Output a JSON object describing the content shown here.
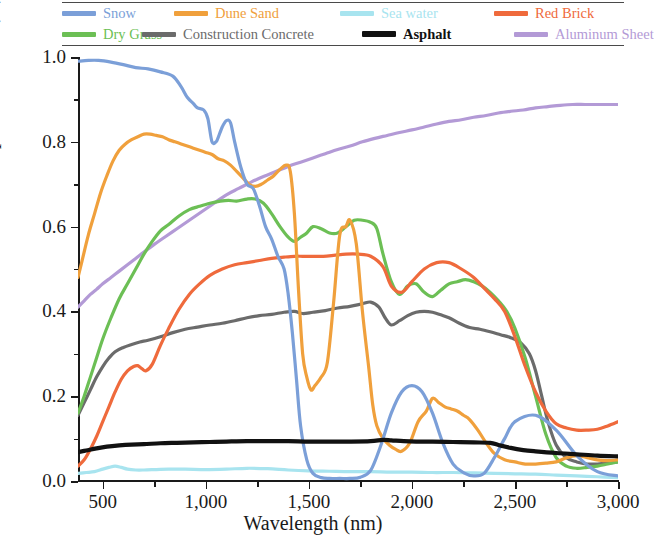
{
  "legend": {
    "rows": [
      [
        {
          "label": "Snow",
          "color": "#7b9fd8",
          "key": "snow"
        },
        {
          "label": "Dune Sand",
          "color": "#f0a03c",
          "key": "dune_sand"
        },
        {
          "label": "Sea water",
          "color": "#a8e4ef",
          "key": "sea_water"
        },
        {
          "label": "Red Brick",
          "color": "#ef6a3c",
          "key": "red_brick"
        }
      ],
      [
        {
          "label": "Dry Grass",
          "color": "#6cbf55",
          "key": "dry_grass"
        },
        {
          "label": "Construction Concrete",
          "color": "#6b6b6b",
          "key": "concrete"
        },
        {
          "label": "Asphalt",
          "color": "#111111",
          "key": "asphalt"
        },
        {
          "label": "Aluminum Sheet",
          "color": "#b39ad6",
          "key": "aluminum_sheet"
        }
      ]
    ]
  },
  "axes": {
    "x_label": "Wavelength (nm)",
    "y_label": "Spectral Albedo (%)",
    "x_ticks": [
      "500",
      "1,000",
      "1,500",
      "2,000",
      "2,500",
      "3,000"
    ],
    "x_tick_values": [
      500,
      1000,
      1500,
      2000,
      2500,
      3000
    ],
    "y_ticks": [
      "0.0",
      "0.2",
      "0.4",
      "0.6",
      "0.8",
      "1.0"
    ],
    "y_tick_values": [
      0.0,
      0.2,
      0.4,
      0.6,
      0.8,
      1.0
    ],
    "x_min": 380,
    "x_max": 3000,
    "y_min": 0.0,
    "y_max": 1.0
  },
  "chart_data": {
    "type": "line",
    "title": "",
    "xlabel": "Wavelength (nm)",
    "ylabel": "Spectral Albedo (%)",
    "xlim": [
      380,
      3000
    ],
    "ylim": [
      0.0,
      1.0
    ],
    "grid": false,
    "legend_position": "top",
    "series": [
      {
        "name": "Snow",
        "color": "#7b9fd8",
        "x": [
          380,
          430,
          480,
          540,
          600,
          660,
          720,
          780,
          840,
          880,
          910,
          940,
          960,
          990,
          1010,
          1030,
          1050,
          1060,
          1080,
          1100,
          1120,
          1140,
          1170,
          1200,
          1230,
          1260,
          1290,
          1320,
          1350,
          1380,
          1400,
          1420,
          1440,
          1460,
          1490,
          1520,
          1560,
          1600,
          1650,
          1700,
          1750,
          1800,
          1850,
          1900,
          1950,
          2000,
          2050,
          2100,
          2150,
          2200,
          2250,
          2300,
          2350,
          2400,
          2450,
          2500,
          2600,
          2700,
          2800,
          2900,
          3000
        ],
        "y": [
          0.99,
          0.992,
          0.992,
          0.988,
          0.982,
          0.975,
          0.972,
          0.965,
          0.955,
          0.93,
          0.905,
          0.89,
          0.88,
          0.875,
          0.855,
          0.8,
          0.8,
          0.81,
          0.835,
          0.85,
          0.845,
          0.8,
          0.74,
          0.7,
          0.69,
          0.65,
          0.6,
          0.57,
          0.53,
          0.5,
          0.44,
          0.35,
          0.24,
          0.13,
          0.05,
          0.018,
          0.008,
          0.006,
          0.006,
          0.006,
          0.009,
          0.025,
          0.085,
          0.16,
          0.21,
          0.225,
          0.21,
          0.16,
          0.09,
          0.04,
          0.02,
          0.012,
          0.018,
          0.055,
          0.1,
          0.14,
          0.155,
          0.12,
          0.06,
          0.022,
          0.012
        ]
      },
      {
        "name": "Dune Sand",
        "color": "#f0a03c",
        "x": [
          380,
          400,
          430,
          460,
          490,
          520,
          550,
          580,
          610,
          640,
          670,
          700,
          730,
          760,
          790,
          820,
          850,
          880,
          910,
          940,
          970,
          1000,
          1030,
          1060,
          1090,
          1120,
          1150,
          1180,
          1210,
          1240,
          1270,
          1300,
          1330,
          1360,
          1390,
          1410,
          1430,
          1450,
          1470,
          1490,
          1510,
          1530,
          1560,
          1590,
          1620,
          1650,
          1680,
          1700,
          1730,
          1760,
          1790,
          1810,
          1830,
          1860,
          1890,
          1920,
          1950,
          1990,
          2030,
          2070,
          2100,
          2130,
          2160,
          2190,
          2220,
          2250,
          2280,
          2320,
          2360,
          2400,
          2450,
          2500,
          2550,
          2600,
          2650,
          2700,
          2750,
          2800,
          2850,
          2900,
          2950,
          3000
        ],
        "y": [
          0.48,
          0.52,
          0.58,
          0.63,
          0.68,
          0.72,
          0.755,
          0.78,
          0.795,
          0.805,
          0.812,
          0.818,
          0.818,
          0.815,
          0.812,
          0.805,
          0.8,
          0.795,
          0.79,
          0.785,
          0.78,
          0.775,
          0.77,
          0.76,
          0.755,
          0.745,
          0.73,
          0.715,
          0.7,
          0.695,
          0.7,
          0.71,
          0.72,
          0.735,
          0.745,
          0.73,
          0.63,
          0.45,
          0.3,
          0.245,
          0.215,
          0.225,
          0.245,
          0.28,
          0.42,
          0.58,
          0.6,
          0.615,
          0.56,
          0.4,
          0.27,
          0.18,
          0.13,
          0.1,
          0.085,
          0.075,
          0.07,
          0.09,
          0.14,
          0.165,
          0.195,
          0.185,
          0.175,
          0.17,
          0.165,
          0.155,
          0.145,
          0.12,
          0.09,
          0.065,
          0.05,
          0.045,
          0.04,
          0.04,
          0.042,
          0.045,
          0.055,
          0.06,
          0.055,
          0.05,
          0.048,
          0.05
        ]
      },
      {
        "name": "Sea water",
        "color": "#a8e4ef",
        "x": [
          380,
          420,
          460,
          500,
          530,
          560,
          590,
          620,
          660,
          700,
          760,
          820,
          900,
          1000,
          1100,
          1200,
          1300,
          1400,
          1500,
          1600,
          1700,
          1800,
          1900,
          2000,
          2100,
          2200,
          2300,
          2400,
          2500,
          2600,
          2700,
          2800,
          2900,
          3000
        ],
        "y": [
          0.018,
          0.02,
          0.022,
          0.028,
          0.032,
          0.035,
          0.032,
          0.028,
          0.026,
          0.026,
          0.027,
          0.028,
          0.028,
          0.027,
          0.028,
          0.03,
          0.029,
          0.026,
          0.024,
          0.023,
          0.022,
          0.022,
          0.021,
          0.021,
          0.02,
          0.02,
          0.019,
          0.018,
          0.017,
          0.016,
          0.014,
          0.012,
          0.01,
          0.008
        ]
      },
      {
        "name": "Red Brick",
        "color": "#ef6a3c",
        "x": [
          380,
          410,
          440,
          470,
          500,
          530,
          560,
          590,
          620,
          650,
          670,
          690,
          710,
          740,
          780,
          820,
          870,
          920,
          970,
          1020,
          1080,
          1140,
          1200,
          1260,
          1320,
          1380,
          1430,
          1470,
          1520,
          1570,
          1620,
          1680,
          1740,
          1800,
          1860,
          1900,
          1950,
          2000,
          2060,
          2120,
          2180,
          2240,
          2300,
          2360,
          2400,
          2450,
          2500,
          2550,
          2600,
          2650,
          2700,
          2750,
          2800,
          2850,
          2900,
          2950,
          3000
        ],
        "y": [
          0.035,
          0.05,
          0.075,
          0.105,
          0.14,
          0.175,
          0.21,
          0.24,
          0.26,
          0.27,
          0.272,
          0.265,
          0.26,
          0.275,
          0.32,
          0.36,
          0.405,
          0.44,
          0.465,
          0.485,
          0.5,
          0.51,
          0.515,
          0.52,
          0.525,
          0.528,
          0.53,
          0.53,
          0.53,
          0.53,
          0.532,
          0.535,
          0.535,
          0.53,
          0.505,
          0.46,
          0.445,
          0.47,
          0.5,
          0.515,
          0.515,
          0.5,
          0.48,
          0.45,
          0.43,
          0.4,
          0.34,
          0.27,
          0.21,
          0.165,
          0.135,
          0.125,
          0.12,
          0.12,
          0.122,
          0.13,
          0.14
        ]
      },
      {
        "name": "Dry Grass",
        "color": "#6cbf55",
        "x": [
          380,
          410,
          440,
          470,
          500,
          540,
          580,
          620,
          660,
          700,
          740,
          780,
          820,
          870,
          920,
          970,
          1020,
          1070,
          1110,
          1150,
          1200,
          1240,
          1280,
          1320,
          1360,
          1400,
          1430,
          1460,
          1490,
          1520,
          1560,
          1600,
          1640,
          1680,
          1720,
          1760,
          1800,
          1830,
          1860,
          1900,
          1940,
          1980,
          2020,
          2060,
          2100,
          2140,
          2180,
          2220,
          2260,
          2300,
          2340,
          2380,
          2420,
          2460,
          2500,
          2550,
          2600,
          2650,
          2700,
          2750,
          2800,
          2850,
          2900,
          2950,
          3000
        ],
        "y": [
          0.16,
          0.2,
          0.245,
          0.29,
          0.335,
          0.385,
          0.43,
          0.465,
          0.5,
          0.535,
          0.565,
          0.59,
          0.605,
          0.625,
          0.64,
          0.648,
          0.655,
          0.66,
          0.662,
          0.66,
          0.665,
          0.665,
          0.655,
          0.63,
          0.6,
          0.575,
          0.565,
          0.575,
          0.585,
          0.6,
          0.595,
          0.585,
          0.585,
          0.6,
          0.615,
          0.615,
          0.61,
          0.595,
          0.535,
          0.47,
          0.44,
          0.46,
          0.465,
          0.445,
          0.435,
          0.45,
          0.465,
          0.47,
          0.475,
          0.47,
          0.46,
          0.445,
          0.425,
          0.4,
          0.36,
          0.29,
          0.2,
          0.11,
          0.055,
          0.035,
          0.03,
          0.032,
          0.035,
          0.04,
          0.045
        ]
      },
      {
        "name": "Construction Concrete",
        "color": "#6b6b6b",
        "x": [
          380,
          410,
          440,
          470,
          500,
          530,
          560,
          600,
          640,
          680,
          720,
          780,
          840,
          900,
          960,
          1020,
          1080,
          1140,
          1200,
          1260,
          1320,
          1380,
          1430,
          1470,
          1520,
          1580,
          1640,
          1700,
          1760,
          1800,
          1840,
          1870,
          1900,
          1940,
          1980,
          2020,
          2060,
          2100,
          2140,
          2180,
          2230,
          2280,
          2330,
          2380,
          2430,
          2480,
          2530,
          2570,
          2600,
          2630,
          2660,
          2700,
          2750,
          2800,
          2850,
          2900,
          2950,
          3000
        ],
        "y": [
          0.155,
          0.185,
          0.215,
          0.245,
          0.27,
          0.29,
          0.305,
          0.315,
          0.322,
          0.328,
          0.332,
          0.34,
          0.35,
          0.358,
          0.363,
          0.368,
          0.372,
          0.378,
          0.385,
          0.39,
          0.393,
          0.398,
          0.4,
          0.395,
          0.398,
          0.402,
          0.408,
          0.412,
          0.418,
          0.422,
          0.41,
          0.385,
          0.368,
          0.378,
          0.39,
          0.398,
          0.4,
          0.398,
          0.392,
          0.385,
          0.372,
          0.362,
          0.358,
          0.352,
          0.345,
          0.338,
          0.325,
          0.3,
          0.26,
          0.2,
          0.14,
          0.085,
          0.055,
          0.045,
          0.04,
          0.04,
          0.042,
          0.045
        ]
      },
      {
        "name": "Asphalt",
        "color": "#111111",
        "x": [
          380,
          420,
          470,
          520,
          580,
          640,
          700,
          780,
          860,
          940,
          1020,
          1100,
          1200,
          1300,
          1400,
          1500,
          1600,
          1700,
          1800,
          1860,
          1900,
          1960,
          2020,
          2100,
          2200,
          2300,
          2380,
          2420,
          2480,
          2540,
          2600,
          2700,
          2800,
          2900,
          3000
        ],
        "y": [
          0.068,
          0.072,
          0.077,
          0.081,
          0.084,
          0.086,
          0.087,
          0.089,
          0.09,
          0.091,
          0.092,
          0.093,
          0.094,
          0.094,
          0.094,
          0.093,
          0.093,
          0.093,
          0.094,
          0.097,
          0.096,
          0.094,
          0.093,
          0.093,
          0.092,
          0.091,
          0.09,
          0.085,
          0.078,
          0.073,
          0.07,
          0.066,
          0.063,
          0.06,
          0.058
        ]
      },
      {
        "name": "Aluminum Sheet",
        "color": "#b39ad6",
        "x": [
          380,
          410,
          440,
          470,
          500,
          540,
          580,
          620,
          660,
          700,
          750,
          800,
          860,
          920,
          980,
          1040,
          1100,
          1160,
          1220,
          1280,
          1340,
          1400,
          1460,
          1520,
          1580,
          1640,
          1700,
          1760,
          1820,
          1880,
          1940,
          2000,
          2060,
          2120,
          2180,
          2240,
          2300,
          2360,
          2420,
          2480,
          2540,
          2600,
          2660,
          2720,
          2780,
          2840,
          2900,
          2950,
          3000
        ],
        "y": [
          0.41,
          0.425,
          0.44,
          0.452,
          0.465,
          0.48,
          0.495,
          0.51,
          0.525,
          0.54,
          0.558,
          0.575,
          0.595,
          0.615,
          0.635,
          0.655,
          0.675,
          0.69,
          0.705,
          0.718,
          0.73,
          0.742,
          0.752,
          0.762,
          0.772,
          0.782,
          0.79,
          0.8,
          0.808,
          0.815,
          0.822,
          0.828,
          0.835,
          0.842,
          0.848,
          0.852,
          0.858,
          0.862,
          0.868,
          0.872,
          0.875,
          0.88,
          0.883,
          0.886,
          0.888,
          0.888,
          0.888,
          0.888,
          0.888
        ]
      }
    ]
  }
}
